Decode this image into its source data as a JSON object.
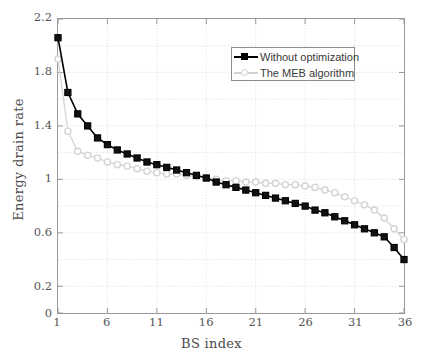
{
  "chart_data": {
    "type": "line",
    "title": "",
    "xlabel": "BS index",
    "ylabel": "Energy drain rate",
    "xlim": [
      1,
      36
    ],
    "ylim": [
      0,
      2.2
    ],
    "xticks": [
      1,
      6,
      11,
      16,
      21,
      26,
      31,
      36
    ],
    "xtick_labels": [
      "1",
      "6",
      "11",
      "16",
      "21",
      "26",
      "31",
      "36"
    ],
    "yticks": [
      0,
      0.2,
      0.6,
      1,
      1.4,
      1.8,
      2.2
    ],
    "ytick_labels": [
      "0",
      "0.2",
      "0.6",
      "1",
      "1.4",
      "1.8",
      "2.2"
    ],
    "grid": true,
    "legend_position": "upper right",
    "x": [
      1,
      2,
      3,
      4,
      5,
      6,
      7,
      8,
      9,
      10,
      11,
      12,
      13,
      14,
      15,
      16,
      17,
      18,
      19,
      20,
      21,
      22,
      23,
      24,
      25,
      26,
      27,
      28,
      29,
      30,
      31,
      32,
      33,
      34,
      35,
      36
    ],
    "series": [
      {
        "name": "Without optimization",
        "color": "#000000",
        "marker": "square",
        "values": [
          2.06,
          1.65,
          1.49,
          1.4,
          1.31,
          1.26,
          1.22,
          1.19,
          1.16,
          1.13,
          1.11,
          1.09,
          1.07,
          1.05,
          1.03,
          1.01,
          0.98,
          0.96,
          0.94,
          0.92,
          0.9,
          0.88,
          0.86,
          0.84,
          0.82,
          0.8,
          0.77,
          0.75,
          0.72,
          0.69,
          0.66,
          0.63,
          0.6,
          0.57,
          0.49,
          0.4
        ]
      },
      {
        "name": "The MEB algorithm",
        "color": "#d4d4d4",
        "marker": "circle",
        "values": [
          1.9,
          1.36,
          1.21,
          1.18,
          1.16,
          1.13,
          1.11,
          1.1,
          1.08,
          1.06,
          1.05,
          1.04,
          1.04,
          1.03,
          1.02,
          1.01,
          1.0,
          0.99,
          0.99,
          0.98,
          0.98,
          0.97,
          0.97,
          0.96,
          0.96,
          0.95,
          0.94,
          0.92,
          0.9,
          0.87,
          0.84,
          0.81,
          0.77,
          0.71,
          0.63,
          0.55
        ]
      }
    ]
  }
}
